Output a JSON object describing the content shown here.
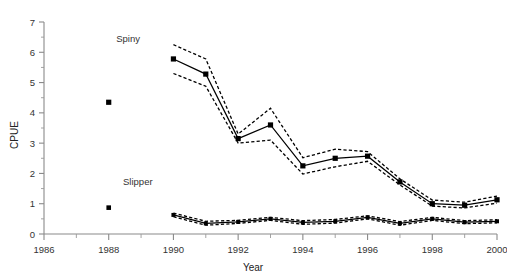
{
  "chart_data": {
    "type": "line",
    "title": "",
    "xlabel": "Year",
    "ylabel": "CPUE",
    "xlim": [
      1986,
      2000
    ],
    "ylim": [
      0,
      7
    ],
    "grid": false,
    "legend_position": "inline-annotations",
    "x_ticks": [
      1986,
      1988,
      1990,
      1992,
      1994,
      1996,
      1998,
      2000
    ],
    "x_minor_ticks": [
      1987,
      1989,
      1991,
      1993,
      1995,
      1997,
      1999
    ],
    "y_ticks": [
      0,
      1,
      2,
      3,
      4,
      5,
      6,
      7
    ],
    "y_minor_ticks": [
      0.5,
      1.5,
      2.5,
      3.5,
      4.5,
      5.5,
      6.5
    ],
    "annotations": [
      {
        "text": "Spiny",
        "x": 1988.6,
        "y": 6.35
      },
      {
        "text": "Slipper",
        "x": 1988.9,
        "y": 1.62
      }
    ],
    "series": [
      {
        "name": "Spiny",
        "style": "solid-line-with-square-markers",
        "isolated_points": [
          {
            "x": 1988,
            "y": 4.35
          }
        ],
        "x": [
          1990,
          1991,
          1992,
          1993,
          1994,
          1995,
          1996,
          1997,
          1998,
          1999,
          2000
        ],
        "values": [
          5.78,
          5.28,
          3.15,
          3.6,
          2.25,
          2.5,
          2.57,
          1.72,
          1.0,
          0.95,
          1.13
        ],
        "ci_upper": [
          6.25,
          5.78,
          3.3,
          4.15,
          2.52,
          2.8,
          2.72,
          1.82,
          1.12,
          1.05,
          1.25
        ],
        "ci_lower": [
          5.3,
          4.88,
          3.0,
          3.1,
          1.98,
          2.22,
          2.4,
          1.62,
          0.92,
          0.86,
          1.02
        ]
      },
      {
        "name": "Slipper",
        "style": "solid-line-with-square-markers",
        "isolated_points": [
          {
            "x": 1988,
            "y": 0.87
          }
        ],
        "x": [
          1990,
          1991,
          1992,
          1993,
          1994,
          1995,
          1996,
          1997,
          1998,
          1999,
          2000
        ],
        "values": [
          0.63,
          0.35,
          0.4,
          0.5,
          0.38,
          0.42,
          0.55,
          0.35,
          0.5,
          0.39,
          0.42
        ],
        "ci_upper": [
          0.69,
          0.42,
          0.45,
          0.55,
          0.44,
          0.48,
          0.6,
          0.41,
          0.55,
          0.44,
          0.47
        ],
        "ci_lower": [
          0.57,
          0.29,
          0.35,
          0.45,
          0.32,
          0.36,
          0.5,
          0.29,
          0.45,
          0.34,
          0.37
        ]
      }
    ]
  },
  "axes": {
    "y_title": "CPUE",
    "x_title": "Year",
    "y_tick_labels": [
      "0",
      "1",
      "2",
      "3",
      "4",
      "5",
      "6",
      "7"
    ],
    "x_tick_labels": [
      "1986",
      "1988",
      "1990",
      "1992",
      "1994",
      "1996",
      "1998",
      "2000"
    ]
  },
  "colors": {
    "line": "#000000",
    "axis": "#8a8a8a",
    "text": "#333333",
    "background": "#ffffff"
  }
}
